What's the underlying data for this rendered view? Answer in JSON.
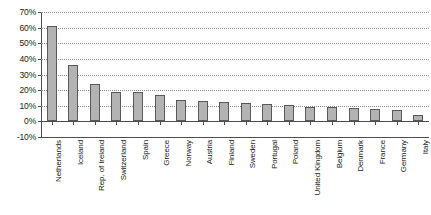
{
  "chart_data": {
    "type": "bar",
    "title": "",
    "xlabel": "",
    "ylabel": "",
    "categories": [
      "Netherlands",
      "Iceland",
      "Rep. of Ireland",
      "Switzerland",
      "Spain",
      "Greece",
      "Norway",
      "Austria",
      "Finland",
      "Sweden",
      "Portugal",
      "Poland",
      "United Kingdom",
      "Belgium",
      "Denmark",
      "France",
      "Germany",
      "Italy"
    ],
    "values": [
      61,
      36,
      24,
      19,
      18.5,
      17,
      14,
      13,
      12.5,
      12,
      11,
      10.5,
      9.5,
      9,
      8.5,
      8,
      7,
      4
    ],
    "ylim": [
      -10,
      70
    ],
    "ytick_labels": [
      "70%",
      "60%",
      "50%",
      "40%",
      "30%",
      "20%",
      "10%",
      "0%",
      "-10%"
    ],
    "ytick_values": [
      70,
      60,
      50,
      40,
      30,
      20,
      10,
      0,
      -10
    ],
    "grid": true,
    "legend": false,
    "bar_color": "#b3b3b3",
    "bar_border_color": "#595959",
    "gridline_color": "#8c8c8c",
    "axis_color": "#4d4d4d"
  }
}
